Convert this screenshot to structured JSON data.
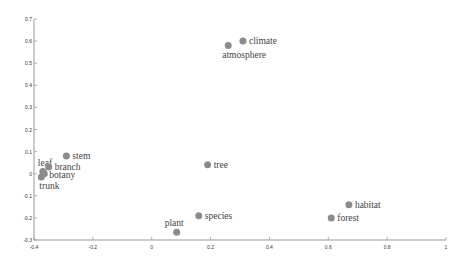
{
  "chart_data": {
    "type": "scatter",
    "title": "",
    "xlabel": "",
    "ylabel": "",
    "xlim": [
      -0.4,
      1
    ],
    "ylim": [
      -0.3,
      0.7
    ],
    "grid": false,
    "legend": null,
    "x_ticks": [
      "-0.4",
      "-0.2",
      "0",
      "0.2",
      "0.4",
      "0.6",
      "0.8",
      "1"
    ],
    "y_ticks": [
      "-0.3",
      "-0.2",
      "-0.1",
      "0",
      "0.1",
      "0.2",
      "0.3",
      "0.4",
      "0.5",
      "0.6",
      "0.7"
    ],
    "marker_color": "#8c8c8c",
    "points": [
      {
        "label": "climate",
        "x": 0.31,
        "y": 0.6,
        "label_pos": "right"
      },
      {
        "label": "atmosphere",
        "x": 0.26,
        "y": 0.58,
        "label_pos": "below"
      },
      {
        "label": "stem",
        "x": -0.29,
        "y": 0.08,
        "label_pos": "right"
      },
      {
        "label": "leaf",
        "x": -0.37,
        "y": 0.01,
        "label_pos": "above"
      },
      {
        "label": "branch",
        "x": -0.35,
        "y": 0.03,
        "label_pos": "right"
      },
      {
        "label": "botany",
        "x": -0.365,
        "y": 0.0,
        "label_pos": "right"
      },
      {
        "label": "trunk",
        "x": -0.375,
        "y": -0.015,
        "label_pos": "below"
      },
      {
        "label": "tree",
        "x": 0.19,
        "y": 0.04,
        "label_pos": "right"
      },
      {
        "label": "habitat",
        "x": 0.67,
        "y": -0.14,
        "label_pos": "right"
      },
      {
        "label": "forest",
        "x": 0.61,
        "y": -0.2,
        "label_pos": "right"
      },
      {
        "label": "species",
        "x": 0.16,
        "y": -0.19,
        "label_pos": "right"
      },
      {
        "label": "plant",
        "x": 0.085,
        "y": -0.265,
        "label_pos": "above"
      }
    ]
  }
}
